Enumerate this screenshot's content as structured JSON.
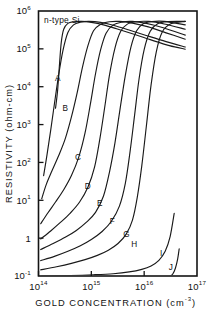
{
  "chart_data": {
    "type": "line",
    "title": "",
    "annotation": "n-type Si",
    "xlabel": "GOLD CONCENTRATION",
    "xlabel_units": "(cm",
    "xlabel_units_exp": "-3",
    "xlabel_units_close": ")",
    "ylabel": "RESISTIVITY (ohm-cm)",
    "xscale": "log",
    "yscale": "log",
    "xlim": [
      100000000000000.0,
      1e+17
    ],
    "ylim": [
      0.1,
      1000000
    ],
    "grid": false,
    "legend": "none",
    "xticks": [
      {
        "value": 100000000000000.0,
        "mantissa": "10",
        "exponent": "14"
      },
      {
        "value": 1000000000000000.0,
        "mantissa": "10",
        "exponent": "15"
      },
      {
        "value": 1e+16,
        "mantissa": "10",
        "exponent": "16"
      },
      {
        "value": 1e+17,
        "mantissa": "10",
        "exponent": "17"
      }
    ],
    "yticks": [
      {
        "value": 1000000,
        "mantissa": "10",
        "exponent": "6"
      },
      {
        "value": 100000,
        "mantissa": "10",
        "exponent": "5"
      },
      {
        "value": 10000,
        "mantissa": "10",
        "exponent": "4"
      },
      {
        "value": 1000,
        "mantissa": "10",
        "exponent": "3"
      },
      {
        "value": 100,
        "mantissa": "10",
        "exponent": "2"
      },
      {
        "value": 10,
        "mantissa": "10",
        "exponent": "1"
      },
      {
        "value": 1,
        "mantissa": "1",
        "exponent": ""
      },
      {
        "value": 0.1,
        "mantissa": "10",
        "exponent": "-1"
      }
    ],
    "series": [
      {
        "name": "A",
        "label": "A",
        "label_x": 230000000000000.0,
        "label_y": 14000,
        "points": [
          [
            210000000000000.0,
            2700
          ],
          [
            230000000000000.0,
            8000
          ],
          [
            250000000000000.0,
            40000
          ],
          [
            270000000000000.0,
            150000
          ],
          [
            300000000000000.0,
            330000
          ],
          [
            360000000000000.0,
            470000
          ],
          [
            460000000000000.0,
            520000
          ],
          [
            650000000000000.0,
            530000
          ],
          [
            1000000000000000.0,
            500000
          ],
          [
            1700000000000000.0,
            430000
          ],
          [
            3000000000000000.0,
            340000
          ],
          [
            6000000000000000.0,
            250000
          ],
          [
            1.3e+16,
            175000
          ],
          [
            3e+16,
            122000
          ],
          [
            6e+16,
            98000
          ]
        ]
      },
      {
        "name": "B",
        "label": "B",
        "label_x": 320000000000000.0,
        "label_y": 2300,
        "points": [
          [
            125000000000000.0,
            45
          ],
          [
            145000000000000.0,
            160
          ],
          [
            170000000000000.0,
            700
          ],
          [
            200000000000000.0,
            3500
          ],
          [
            240000000000000.0,
            20000
          ],
          [
            290000000000000.0,
            90000
          ],
          [
            360000000000000.0,
            270000
          ],
          [
            460000000000000.0,
            430000
          ],
          [
            620000000000000.0,
            505000
          ],
          [
            900000000000000.0,
            530000
          ],
          [
            1500000000000000.0,
            500000
          ],
          [
            2600000000000000.0,
            420000
          ],
          [
            5000000000000000.0,
            320000
          ],
          [
            1.1e+16,
            225000
          ],
          [
            2.6e+16,
            155000
          ],
          [
            6e+16,
            112000
          ]
        ]
      },
      {
        "name": "C",
        "label": "C",
        "label_x": 560000000000000.0,
        "label_y": 115,
        "points": [
          [
            115000000000000.0,
            11
          ],
          [
            140000000000000.0,
            26
          ],
          [
            180000000000000.0,
            60
          ],
          [
            240000000000000.0,
            150
          ],
          [
            320000000000000.0,
            420
          ],
          [
            420000000000000.0,
            1600
          ],
          [
            540000000000000.0,
            7000
          ],
          [
            680000000000000.0,
            33000
          ],
          [
            860000000000000.0,
            120000
          ],
          [
            1100000000000000.0,
            300000
          ],
          [
            1500000000000000.0,
            450000
          ],
          [
            2200000000000000.0,
            520000
          ],
          [
            3400000000000000.0,
            530000
          ],
          [
            6000000000000000.0,
            480000
          ],
          [
            1.2e+16,
            380000
          ],
          [
            2.6e+16,
            265000
          ],
          [
            6e+16,
            180000
          ]
        ]
      },
      {
        "name": "D",
        "label": "D",
        "label_x": 850000000000000.0,
        "label_y": 20,
        "points": [
          [
            110000000000000.0,
            2.4
          ],
          [
            150000000000000.0,
            4.6
          ],
          [
            210000000000000.0,
            9
          ],
          [
            300000000000000.0,
            19
          ],
          [
            420000000000000.0,
            45
          ],
          [
            580000000000000.0,
            140
          ],
          [
            760000000000000.0,
            600
          ],
          [
            960000000000000.0,
            3500
          ],
          [
            1200000000000000.0,
            22000
          ],
          [
            1500000000000000.0,
            95000
          ],
          [
            1900000000000000.0,
            260000
          ],
          [
            2600000000000000.0,
            430000
          ],
          [
            3800000000000000.0,
            510000
          ],
          [
            6000000000000000.0,
            530000
          ],
          [
            1.1e+16,
            470000
          ],
          [
            2.3e+16,
            360000
          ],
          [
            6e+16,
            230000
          ]
        ]
      },
      {
        "name": "E",
        "label": "E",
        "label_x": 1450000000000000.0,
        "label_y": 7.0,
        "points": [
          [
            110000000000000.0,
            0.95
          ],
          [
            170000000000000.0,
            1.55
          ],
          [
            260000000000000.0,
            2.6
          ],
          [
            400000000000000.0,
            4.6
          ],
          [
            600000000000000.0,
            9
          ],
          [
            860000000000000.0,
            22
          ],
          [
            1150000000000000.0,
            75
          ],
          [
            1450000000000000.0,
            420
          ],
          [
            1800000000000000.0,
            3000
          ],
          [
            2200000000000000.0,
            20000
          ],
          [
            2800000000000000.0,
            105000
          ],
          [
            3600000000000000.0,
            290000
          ],
          [
            4800000000000000.0,
            450000
          ],
          [
            7000000000000000.0,
            520000
          ],
          [
            1.2e+16,
            530000
          ],
          [
            2.4e+16,
            455000
          ],
          [
            6e+16,
            330000
          ]
        ]
      },
      {
        "name": "F",
        "label": "F",
        "label_x": 2500000000000000.0,
        "label_y": 2.4,
        "points": [
          [
            110000000000000.0,
            0.5
          ],
          [
            190000000000000.0,
            0.72
          ],
          [
            320000000000000.0,
            1.05
          ],
          [
            520000000000000.0,
            1.6
          ],
          [
            800000000000000.0,
            2.6
          ],
          [
            1200000000000000.0,
            4.8
          ],
          [
            1700000000000000.0,
            13
          ],
          [
            2200000000000000.0,
            55
          ],
          [
            2800000000000000.0,
            330
          ],
          [
            3500000000000000.0,
            2600
          ],
          [
            4400000000000000.0,
            20000
          ],
          [
            5600000000000000.0,
            110000
          ],
          [
            7200000000000000.0,
            300000
          ],
          [
            9600000000000000.0,
            460000
          ],
          [
            1.4e+16,
            525000
          ],
          [
            2.4e+16,
            530000
          ],
          [
            6e+16,
            430000
          ]
        ]
      },
      {
        "name": "G",
        "label": "G",
        "label_x": 4600000000000000.0,
        "label_y": 1.05,
        "points": [
          [
            110000000000000.0,
            0.255
          ],
          [
            200000000000000.0,
            0.33
          ],
          [
            360000000000000.0,
            0.45
          ],
          [
            620000000000000.0,
            0.63
          ],
          [
            1000000000000000.0,
            0.92
          ],
          [
            1600000000000000.0,
            1.5
          ],
          [
            2400000000000000.0,
            2.8
          ],
          [
            3400000000000000.0,
            7
          ],
          [
            4400000000000000.0,
            28
          ],
          [
            5400000000000000.0,
            190
          ],
          [
            6600000000000000.0,
            1800
          ],
          [
            8000000000000000.0,
            16000
          ],
          [
            1e+16,
            95000
          ],
          [
            1.3e+16,
            290000
          ],
          [
            1.8e+16,
            460000
          ],
          [
            2.8e+16,
            525000
          ],
          [
            6e+16,
            530000
          ]
        ]
      },
      {
        "name": "H",
        "label": "H",
        "label_x": 6500000000000000.0,
        "label_y": 0.58,
        "points": [
          [
            110000000000000.0,
            0.145
          ],
          [
            220000000000000.0,
            0.175
          ],
          [
            420000000000000.0,
            0.215
          ],
          [
            760000000000000.0,
            0.27
          ],
          [
            1300000000000000.0,
            0.35
          ],
          [
            2100000000000000.0,
            0.48
          ],
          [
            3200000000000000.0,
            0.72
          ],
          [
            4600000000000000.0,
            1.3
          ],
          [
            6000000000000000.0,
            3.0
          ],
          [
            7400000000000000.0,
            12
          ],
          [
            9000000000000000.0,
            80
          ],
          [
            1.1e+16,
            900
          ],
          [
            1.35e+16,
            11000
          ],
          [
            1.7e+16,
            85000
          ],
          [
            2.2e+16,
            280000
          ],
          [
            3.2e+16,
            460000
          ],
          [
            6e+16,
            530000
          ]
        ]
      },
      {
        "name": "I",
        "label": "I",
        "label_x": 2.1e+16,
        "label_y": 0.33,
        "points": [
          [
            115000000000000.0,
            0.1
          ],
          [
            400000000000000.0,
            0.103
          ],
          [
            1100000000000000.0,
            0.108
          ],
          [
            2600000000000000.0,
            0.115
          ],
          [
            5200000000000000.0,
            0.128
          ],
          [
            9000000000000000.0,
            0.15
          ],
          [
            1.35e+16,
            0.185
          ],
          [
            1.9e+16,
            0.26
          ],
          [
            2.5e+16,
            0.45
          ],
          [
            3.1e+16,
            1.1
          ],
          [
            3.7e+16,
            4.5
          ]
        ]
      },
      {
        "name": "J",
        "label": "J",
        "label_x": 3.2e+16,
        "label_y": 0.145,
        "points": [
          [
            3.1e+16,
            0.098
          ],
          [
            3.5e+16,
            0.115
          ],
          [
            3.9e+16,
            0.16
          ],
          [
            4.3e+16,
            0.28
          ],
          [
            4.6e+16,
            0.52
          ]
        ]
      }
    ]
  }
}
